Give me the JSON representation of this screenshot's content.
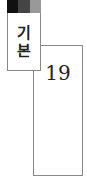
{
  "tab": {
    "label_line1": "기",
    "label_line2": "본",
    "swatches": [
      "#111111",
      "#454545",
      "#999999"
    ]
  },
  "page": {
    "number": "19"
  }
}
